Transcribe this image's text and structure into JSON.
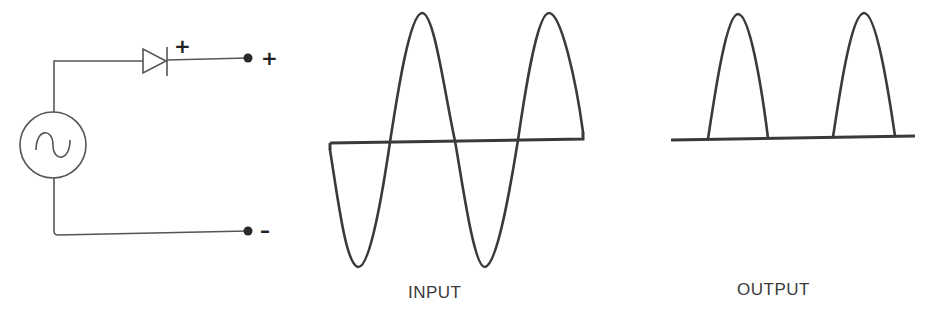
{
  "diagram": {
    "type": "half-wave rectifier",
    "circuit": {
      "source": {
        "symbol": "ac-source",
        "glyph": "~"
      },
      "diode": {
        "symbol": "diode",
        "polarity_mark": "+"
      },
      "terminals": [
        {
          "name": "positive",
          "label": "+"
        },
        {
          "name": "negative",
          "label": "–"
        }
      ]
    },
    "waveforms": {
      "input": {
        "label": "INPUT",
        "description": "full sine wave, two positive and two negative half-cycles"
      },
      "output": {
        "label": "OUTPUT",
        "description": "only positive half-cycles pass"
      }
    },
    "colors": {
      "line": "#3a3a3a",
      "wire": "#555555",
      "background": "#ffffff"
    }
  }
}
